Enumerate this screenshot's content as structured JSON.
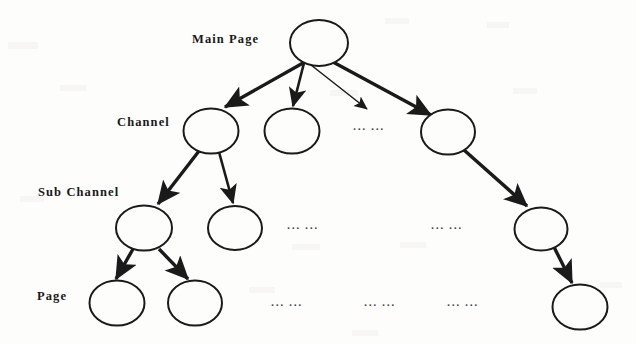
{
  "diagram": {
    "type": "tree-hierarchy",
    "background_color": "#fdfdfc",
    "stroke_color": "#1a1a1a",
    "canvas": {
      "width": 636,
      "height": 344
    },
    "level_labels": [
      {
        "id": "main-page",
        "text": "Main Page",
        "x": 192,
        "y": 33
      },
      {
        "id": "channel",
        "text": "Channel",
        "x": 117,
        "y": 116
      },
      {
        "id": "sub-channel",
        "text": "Sub Channel",
        "x": 38,
        "y": 186
      },
      {
        "id": "page",
        "text": "Page",
        "x": 37,
        "y": 290
      }
    ],
    "nodes": [
      {
        "id": "root",
        "level": "main-page",
        "cx": 319,
        "cy": 43,
        "rx": 29,
        "ry": 23
      },
      {
        "id": "channel-1",
        "level": "channel",
        "cx": 211,
        "cy": 131,
        "rx": 27.5,
        "ry": 22.5
      },
      {
        "id": "channel-2",
        "level": "channel",
        "cx": 292,
        "cy": 131,
        "rx": 27.5,
        "ry": 22.5
      },
      {
        "id": "channel-n",
        "level": "channel",
        "cx": 448,
        "cy": 132,
        "rx": 27,
        "ry": 22.5
      },
      {
        "id": "subchannel-1",
        "level": "sub-channel",
        "cx": 144,
        "cy": 228,
        "rx": 28,
        "ry": 22.5
      },
      {
        "id": "subchannel-2",
        "level": "sub-channel",
        "cx": 235,
        "cy": 228,
        "rx": 27,
        "ry": 22
      },
      {
        "id": "subchannel-n",
        "level": "sub-channel",
        "cx": 541,
        "cy": 229,
        "rx": 26.5,
        "ry": 21.5
      },
      {
        "id": "page-1",
        "level": "page",
        "cx": 117,
        "cy": 303,
        "rx": 27.5,
        "ry": 22.5
      },
      {
        "id": "page-2",
        "level": "page",
        "cx": 195,
        "cy": 303,
        "rx": 27,
        "ry": 22.5
      },
      {
        "id": "page-n",
        "level": "page",
        "cx": 580,
        "cy": 307,
        "rx": 27.5,
        "ry": 22.5
      }
    ],
    "edges": [
      {
        "id": "root-to-channel-1",
        "from": "root",
        "to": "channel-1",
        "x1": 303,
        "y1": 63,
        "x2": 225,
        "y2": 107,
        "weight": "thick"
      },
      {
        "id": "root-to-channel-2",
        "from": "root",
        "to": "channel-2",
        "x1": 304,
        "y1": 63,
        "x2": 293,
        "y2": 106,
        "weight": "medium"
      },
      {
        "id": "root-to-ellipsis",
        "from": "root",
        "to": "channel-ellipsis",
        "x1": 311,
        "y1": 65,
        "x2": 367,
        "y2": 109,
        "weight": "thin"
      },
      {
        "id": "root-to-channel-n",
        "from": "root",
        "to": "channel-n",
        "x1": 333,
        "y1": 62,
        "x2": 431,
        "y2": 115,
        "weight": "thick"
      },
      {
        "id": "channel1-to-sub1",
        "from": "channel-1",
        "to": "subchannel-1",
        "x1": 199,
        "y1": 151,
        "x2": 158,
        "y2": 204,
        "weight": "thick"
      },
      {
        "id": "channel1-to-sub2",
        "from": "channel-1",
        "to": "subchannel-2",
        "x1": 219,
        "y1": 152,
        "x2": 233,
        "y2": 203,
        "weight": "medium"
      },
      {
        "id": "channeln-to-subn",
        "from": "channel-n",
        "to": "subchannel-n",
        "x1": 464,
        "y1": 150,
        "x2": 527,
        "y2": 206,
        "weight": "thick"
      },
      {
        "id": "sub1-to-page1",
        "from": "subchannel-1",
        "to": "page-1",
        "x1": 133,
        "y1": 249,
        "x2": 116,
        "y2": 279,
        "weight": "thick"
      },
      {
        "id": "sub1-to-page2",
        "from": "subchannel-1",
        "to": "page-2",
        "x1": 159,
        "y1": 249,
        "x2": 188,
        "y2": 279,
        "weight": "thick"
      },
      {
        "id": "subn-to-pagen",
        "from": "subchannel-n",
        "to": "page-n",
        "x1": 554,
        "y1": 247,
        "x2": 572,
        "y2": 283,
        "weight": "thick"
      }
    ],
    "ellipsis_marks": [
      {
        "id": "channel-ellipsis",
        "text": "··· ···",
        "x": 353,
        "y": 124
      },
      {
        "id": "subchannel-ellipsis-1",
        "text": "··· ···",
        "x": 287,
        "y": 223
      },
      {
        "id": "subchannel-ellipsis-2",
        "text": "··· ···",
        "x": 431,
        "y": 223
      },
      {
        "id": "page-ellipsis-1",
        "text": "··· ···",
        "x": 271,
        "y": 300
      },
      {
        "id": "page-ellipsis-2",
        "text": "··· ···",
        "x": 364,
        "y": 300
      },
      {
        "id": "page-ellipsis-3",
        "text": "··· ···",
        "x": 447,
        "y": 300
      }
    ]
  }
}
